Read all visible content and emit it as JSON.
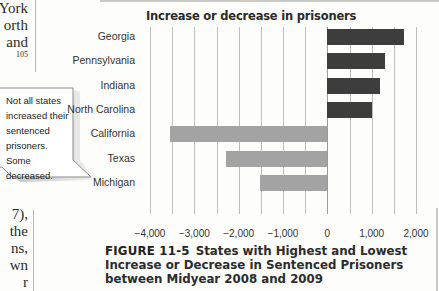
{
  "page": {
    "body_text_top": [
      "York",
      "orth",
      "and"
    ],
    "footnote_ref": "105",
    "body_text_bottom": [
      "7),",
      "the",
      "ns,",
      "wn",
      "r"
    ],
    "callout": {
      "text": "Not all states increased their sentenced prisoners. Some decreased."
    },
    "figure": {
      "label": "FIGURE 11-5",
      "caption": "States with Highest and Lowest Increase or Decrease in Sentenced Prisoners between Midyear 2008 and 2009"
    }
  },
  "colors": {
    "increase_bar": "#3d3d3d",
    "decrease_bar": "#a3a3a3",
    "grid": "#bdbdbb",
    "background": "#fdfdfb"
  },
  "chart_data": {
    "type": "bar",
    "orientation": "horizontal",
    "title": "Increase or decrease in prisoners",
    "xlabel": "",
    "ylabel": "",
    "categories": [
      "Georgia",
      "Pennsylvania",
      "Indiana",
      "North Carolina",
      "California",
      "Texas",
      "Michigan"
    ],
    "values": [
      1720,
      1290,
      1180,
      1010,
      -3540,
      -2290,
      -1530
    ],
    "xlim": [
      -4000,
      2000
    ],
    "x_ticks": [
      -4000,
      -3000,
      -2000,
      -1000,
      0,
      1000,
      2000
    ],
    "x_tick_labels": [
      "−4,000",
      "−3,000",
      "−2,000",
      "−1,000",
      "0",
      "1,000",
      "2,000"
    ],
    "grid": true,
    "grid_step": 500,
    "legend": null
  }
}
